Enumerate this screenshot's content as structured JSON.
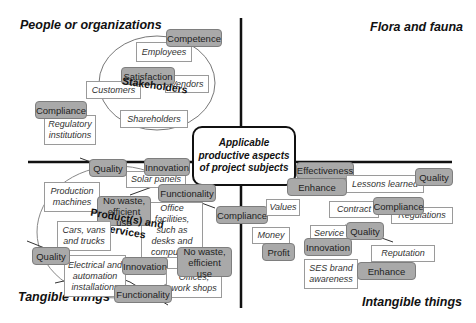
{
  "center": {
    "label": "Applicable productive aspects of project subjects"
  },
  "quadrants": {
    "top_left": "People or organizations",
    "top_right": "Flora and fauna",
    "bottom_left": "Tangible things",
    "bottom_right": "Intangible things"
  },
  "groups": {
    "stakeholders": "Stakeholders",
    "products": "Product(s) and services"
  },
  "subjects": {
    "employees": "Employees",
    "customers": "Customers",
    "vendors": "Vendors",
    "shareholders": "Shareholders",
    "regulatory": "Regulatory institutions",
    "solar_panels": "Solar panels",
    "production_machines": "Production machines",
    "office_facilities": "Office facilities, such as desks and computers",
    "cars": "Cars, vans and trucks",
    "electrical": "Electrical and automation installations",
    "offices": "Offices, work shops",
    "values": "Values",
    "money": "Money",
    "lessons": "Lessons learned",
    "contract": "Contract",
    "regulations": "Regulations",
    "service": "Service",
    "reputation": "Reputation",
    "ses_brand": "SES brand awareness"
  },
  "aspects": {
    "competence": "Competence",
    "satisfaction": "Satisfaction",
    "compliance_people": "Compliance",
    "quality_top": "Quality",
    "innovation_top": "Innovation",
    "functionality_top": "Functionality",
    "no_waste_top": "No waste, efficient use",
    "compliance_center": "Compliance",
    "quality_bottom": "Quality",
    "innovation_bottom": "Innovation",
    "no_waste_bottom": "No waste, efficient use",
    "functionality_bottom": "Functionality",
    "profit": "Profit",
    "effectiveness": "Effectiveness",
    "enhance_top": "Enhance",
    "quality_right": "Quality",
    "compliance_right": "Compliance",
    "quality_intangible": "Quality",
    "innovation_right": "Innovation",
    "enhance_bottom": "Enhance"
  }
}
